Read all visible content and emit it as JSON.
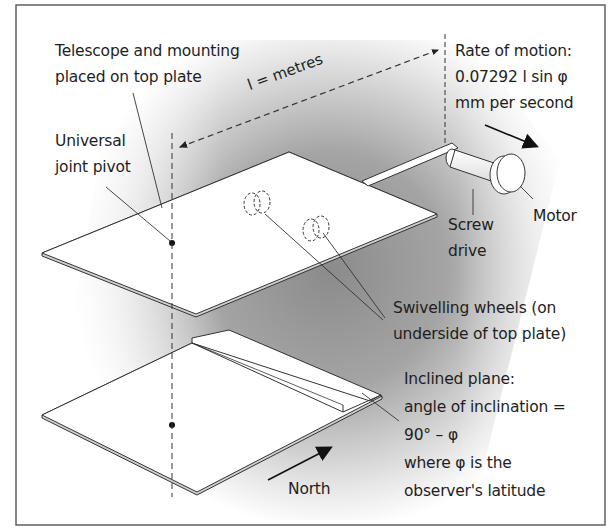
{
  "diagram": {
    "labels": {
      "telescope_mount": [
        "Telescope and mounting",
        "placed on top plate"
      ],
      "universal_joint": [
        "Universal",
        "joint pivot"
      ],
      "length": "l = metres",
      "rate_of_motion": [
        "Rate of motion:",
        "0.07292 l sin φ",
        "mm per second"
      ],
      "screw_drive": [
        "Screw",
        "drive"
      ],
      "motor": "Motor",
      "swivelling_wheels": [
        "Swivelling wheels (on",
        "underside of top plate)"
      ],
      "inclined_plane": [
        "Inclined plane:",
        "angle of inclination =",
        "90° – φ",
        "where φ is the",
        "observer's latitude"
      ],
      "north": "North"
    },
    "colors": {
      "frame": "#555555",
      "line": "#333333",
      "plate_fill": "#ffffff",
      "shade_dark": "#8c8c8c",
      "shade_light": "#ffffff",
      "text": "#1e1e1e"
    },
    "icons": {
      "motion_arrow": "arrow-down-right",
      "north_arrow": "arrow-up-right"
    }
  }
}
